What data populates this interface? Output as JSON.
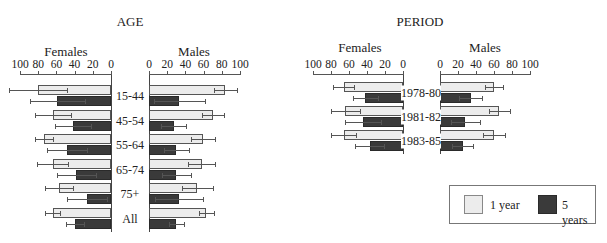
{
  "chart_data": [
    {
      "type": "bar",
      "orientation": "horizontal",
      "layout": "back-to-back (population pyramid style)",
      "title": "AGE",
      "panels": [
        "Females",
        "Males"
      ],
      "categories": [
        "15-44",
        "45-54",
        "55-64",
        "65-74",
        "75+",
        "All"
      ],
      "xlim": [
        0,
        100
      ],
      "ticks": [
        0,
        20,
        40,
        60,
        80,
        100
      ],
      "series": [
        {
          "name": "1 year",
          "sex": "Females",
          "values": [
            80,
            64,
            74,
            64,
            57,
            64
          ],
          "err": [
            32,
            20,
            10,
            17,
            15,
            8
          ]
        },
        {
          "name": "5 years",
          "sex": "Females",
          "values": [
            59,
            42,
            48,
            38,
            26,
            40
          ],
          "err": [
            30,
            20,
            22,
            21,
            22,
            10
          ]
        },
        {
          "name": "1 year",
          "sex": "Males",
          "values": [
            84,
            70,
            59,
            58,
            53,
            63
          ],
          "err": [
            13,
            12,
            13,
            15,
            17,
            8
          ]
        },
        {
          "name": "5 years",
          "sex": "Males",
          "values": [
            33,
            27,
            30,
            30,
            33,
            30
          ],
          "err": [
            28,
            14,
            14,
            16,
            26,
            8
          ]
        }
      ],
      "legend": [
        "1 year",
        "5 years"
      ]
    },
    {
      "type": "bar",
      "orientation": "horizontal",
      "layout": "back-to-back (population pyramid style)",
      "title": "PERIOD",
      "panels": [
        "Females",
        "Males"
      ],
      "categories": [
        "1978-80",
        "1981-82",
        "1983-85"
      ],
      "xlim": [
        0,
        100
      ],
      "ticks": [
        0,
        20,
        40,
        60,
        80,
        100
      ],
      "series": [
        {
          "name": "1 year",
          "sex": "Females",
          "values": [
            66,
            64,
            66
          ],
          "err": [
            12,
            16,
            14
          ]
        },
        {
          "name": "5 years",
          "sex": "Females",
          "values": [
            42,
            44,
            37
          ],
          "err": [
            14,
            20,
            16
          ]
        },
        {
          "name": "1 year",
          "sex": "Males",
          "values": [
            60,
            66,
            60
          ],
          "err": [
            10,
            12,
            12
          ]
        },
        {
          "name": "5 years",
          "sex": "Males",
          "values": [
            34,
            28,
            25
          ],
          "err": [
            13,
            16,
            12
          ]
        }
      ],
      "legend": [
        "1 year",
        "5 years"
      ]
    }
  ],
  "labels": {
    "age_title": "AGE",
    "period_title": "PERIOD",
    "females": "Females",
    "males": "Males",
    "legend_1yr": "1 year",
    "legend_5yr": "5 years"
  },
  "colors": {
    "one_year": "#ececec",
    "five_years": "#3a3a3a"
  }
}
